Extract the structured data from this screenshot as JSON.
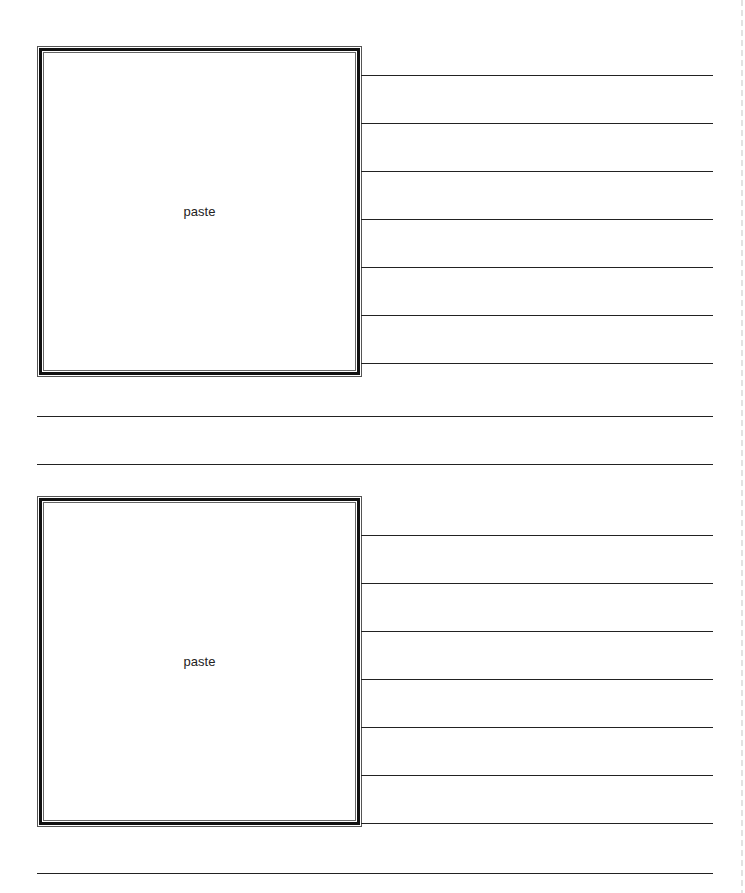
{
  "sheet": {
    "blocks": [
      {
        "photo_placeholder": "paste",
        "side_lines": 7
      },
      {
        "photo_placeholder": "paste",
        "side_lines": 7
      }
    ],
    "full_width_lines_between_blocks": 2,
    "full_width_lines_after": 1
  }
}
